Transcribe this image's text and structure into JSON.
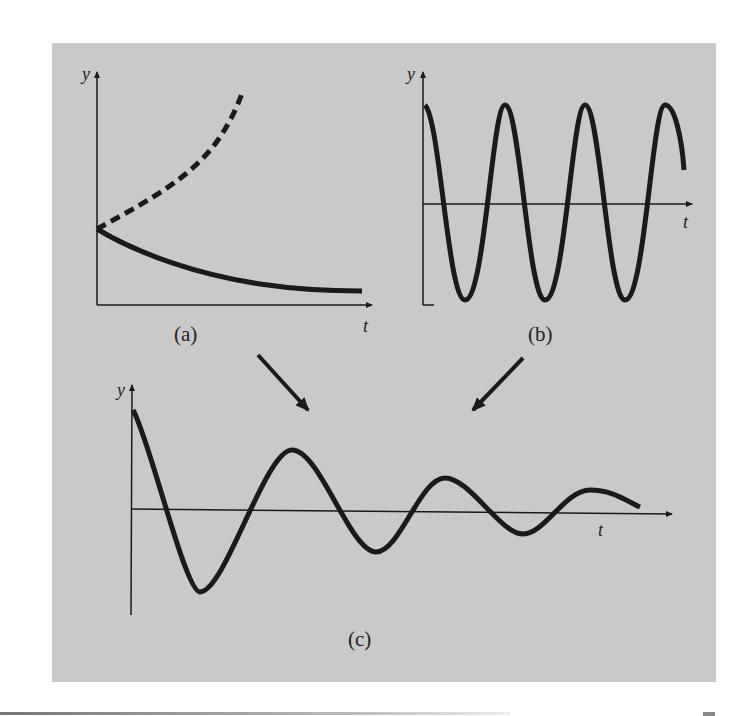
{
  "figure": {
    "panels": [
      {
        "id": "a",
        "caption": "(a)",
        "y_label": "y",
        "x_label": "t",
        "curves": [
          "exponential growth (dashed)",
          "exponential decay (solid)"
        ]
      },
      {
        "id": "b",
        "caption": "(b)",
        "y_label": "y",
        "x_label": "t",
        "curves": [
          "sinusoidal oscillation"
        ]
      },
      {
        "id": "c",
        "caption": "(c)",
        "y_label": "y",
        "x_label": "t",
        "curves": [
          "damped oscillation"
        ]
      }
    ],
    "arrows": [
      "a-to-c",
      "b-to-c"
    ]
  },
  "colors": {
    "background": "#c9c9c9",
    "ink": "#1a1a1a"
  }
}
